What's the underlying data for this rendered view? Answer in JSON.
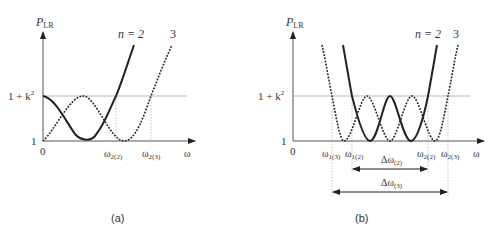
{
  "panel_a": {
    "caption": "(a)",
    "y_axis_label": "P",
    "y_axis_label_sub": "LR",
    "y_tick_top": "1 + k",
    "y_tick_top_sup": "2",
    "y_tick_bottom": "1",
    "x_origin": "0",
    "x_axis_label": "ω",
    "curve_label_n2": "n = 2",
    "curve_label_n3": "3",
    "x_ticks": [
      {
        "main": "ω",
        "sub": "2(2)"
      },
      {
        "main": "ω",
        "sub": "2(3)"
      }
    ]
  },
  "panel_b": {
    "caption": "(b)",
    "y_axis_label": "P",
    "y_axis_label_sub": "LR",
    "y_tick_top": "1 + k",
    "y_tick_top_sup": "2",
    "y_tick_bottom": "1",
    "x_origin": "0",
    "x_axis_label": "ω",
    "curve_label_n2": "n = 2",
    "curve_label_n3": "3",
    "x_ticks": [
      {
        "main": "ω",
        "sub": "1(3)"
      },
      {
        "main": "ω",
        "sub": "1(2)"
      },
      {
        "main": "ω",
        "sub": "2(2)"
      },
      {
        "main": "ω",
        "sub": "2(3)"
      }
    ],
    "bandwidths": [
      {
        "main": "Δω",
        "sub": "(2)"
      },
      {
        "main": "Δω",
        "sub": "(3)"
      }
    ]
  },
  "colors": {
    "ink": "#222222",
    "guide": "#888888"
  }
}
